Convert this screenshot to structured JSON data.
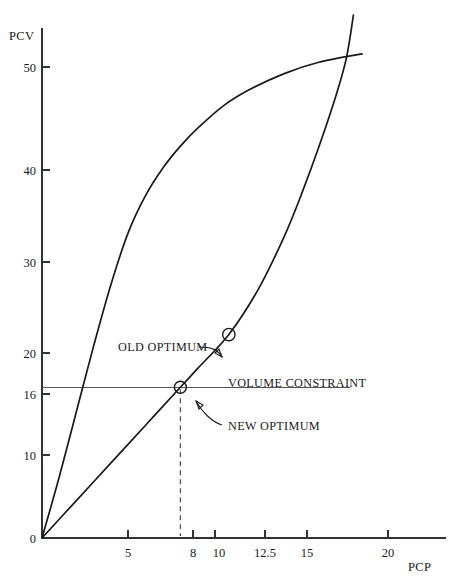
{
  "chart_data": {
    "type": "line",
    "title": "",
    "xlabel": "PCP",
    "ylabel": "PCV",
    "xlim": [
      0,
      22.5
    ],
    "ylim": [
      0,
      56
    ],
    "grid": false,
    "legend_position": "none",
    "x_ticks": [
      {
        "value": 0,
        "label": "0"
      },
      {
        "value": 5,
        "label": "5"
      },
      {
        "value": 8,
        "label": "8"
      },
      {
        "value": 10,
        "label": "10"
      },
      {
        "value": 12.5,
        "label": "12.5"
      },
      {
        "value": 15,
        "label": "15"
      },
      {
        "value": 20,
        "label": "20"
      }
    ],
    "y_ticks": [
      {
        "value": 0,
        "label": "0"
      },
      {
        "value": 10,
        "label": "10"
      },
      {
        "value": 16,
        "label": "16"
      },
      {
        "value": 20,
        "label": "20"
      },
      {
        "value": 30,
        "label": "30"
      },
      {
        "value": 40,
        "label": "40"
      },
      {
        "value": 50,
        "label": "50"
      }
    ],
    "series": [
      {
        "name": "concave-curve",
        "description": "Concave increasing curve rising steeply then flattening",
        "points": [
          [
            0.0,
            0.0
          ],
          [
            1.0,
            6.5
          ],
          [
            2.0,
            13.5
          ],
          [
            3.0,
            20.5
          ],
          [
            4.0,
            27.0
          ],
          [
            5.0,
            32.5
          ],
          [
            6.0,
            36.4
          ],
          [
            7.0,
            39.3
          ],
          [
            8.0,
            41.6
          ],
          [
            9.0,
            43.5
          ],
          [
            10.5,
            45.9
          ],
          [
            12.0,
            47.6
          ],
          [
            14.0,
            49.3
          ],
          [
            16.0,
            50.5
          ],
          [
            18.5,
            51.4
          ]
        ]
      },
      {
        "name": "convex-curve",
        "description": "Convex increasing curve, nearly linear, steepening at the top",
        "points": [
          [
            0.0,
            0.0
          ],
          [
            2.0,
            4.0
          ],
          [
            4.0,
            8.0
          ],
          [
            6.0,
            12.0
          ],
          [
            8.0,
            16.0
          ],
          [
            9.0,
            18.0
          ],
          [
            10.8,
            21.6
          ],
          [
            12.5,
            26.4
          ],
          [
            14.0,
            32.0
          ],
          [
            15.0,
            36.5
          ],
          [
            16.0,
            41.5
          ],
          [
            17.0,
            47.0
          ],
          [
            17.6,
            51.0
          ],
          [
            18.0,
            55.5
          ]
        ]
      }
    ],
    "reference_lines": [
      {
        "name": "volume-constraint",
        "orientation": "horizontal",
        "value": 16,
        "label": "VOLUME CONSTRAINT",
        "x_start": 0,
        "x_end": 17.8
      },
      {
        "name": "new-optimum-drop-line",
        "orientation": "vertical",
        "value": 8,
        "style": "dashed",
        "y_start": 0,
        "y_end": 16
      }
    ],
    "annotations": [
      {
        "name": "old-optimum",
        "label": "OLD OPTIMUM",
        "point": [
          10.8,
          21.6
        ],
        "marker": "open-circle"
      },
      {
        "name": "new-optimum",
        "label": "NEW OPTIMUM",
        "point": [
          8,
          16
        ],
        "marker": "open-circle"
      }
    ]
  },
  "labels": {
    "y_axis_name": "PCV",
    "x_axis_name": "PCP",
    "old_optimum": "OLD OPTIMUM",
    "new_optimum": "NEW OPTIMUM",
    "volume_constraint": "VOLUME CONSTRAINT"
  }
}
